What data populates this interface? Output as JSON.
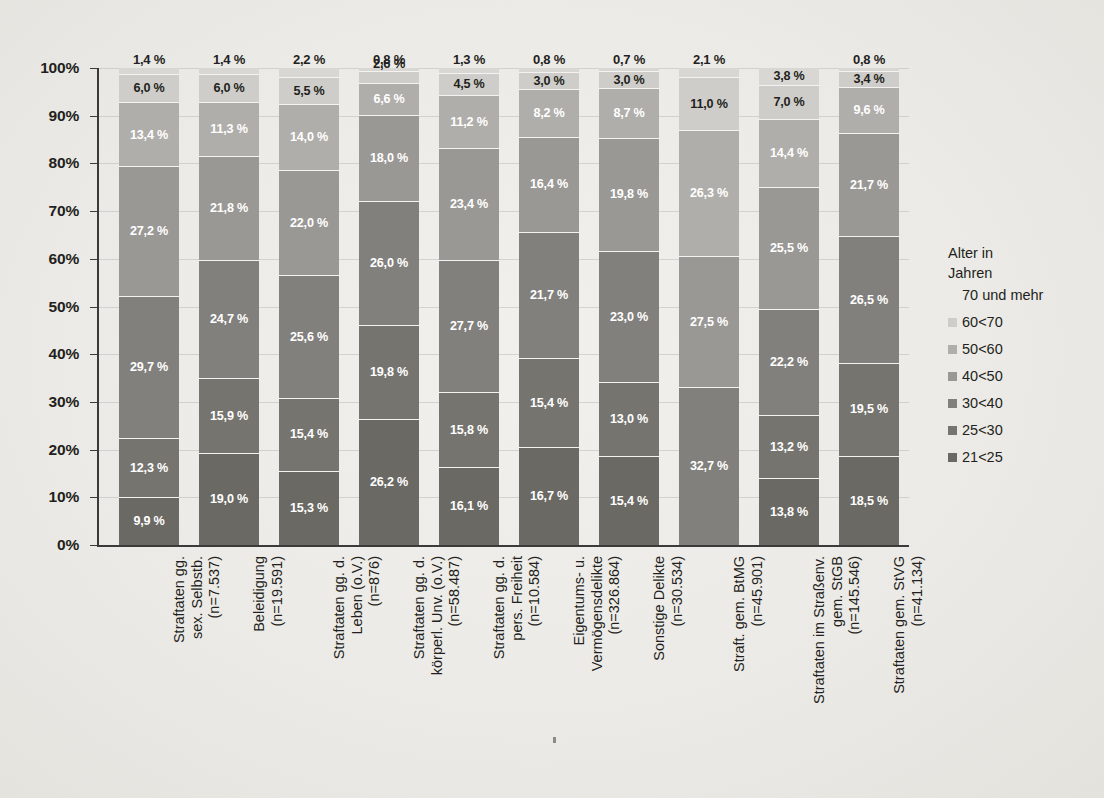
{
  "chart_data": {
    "type": "bar",
    "subtype": "stacked-percentage",
    "title": "",
    "xlabel": "",
    "ylabel": "",
    "ylim": [
      0,
      100
    ],
    "grid": true,
    "legend_position": "right",
    "ytick_labels": [
      "100%",
      "90%",
      "80%",
      "70%",
      "60%",
      "50%",
      "40%",
      "30%",
      "20%",
      "10%",
      "0%"
    ],
    "ytick_values": [
      100,
      90,
      80,
      70,
      60,
      50,
      40,
      30,
      20,
      10,
      0
    ],
    "categories": [
      "Straftaten gg.\nsex. Selbstb.\n(n=7.537)",
      "Beleidigung\n(n=19.591)",
      "Straftaten gg. d.\nLeben (o.V.)\n(n=876)",
      "Straftaten gg. d.\nkörperl. Unv. (o.V.)\n(n=58.487)",
      "Straftaten gg. d.\npers. Freiheit\n(n=10.584)",
      "Eigentums- u.\nVermögensdelikte\n(n=326.864)",
      "Sonstige Delikte\n(n=30.534)",
      "Straft. gem. BtMG\n(n=45.901)",
      "Straftaten im Straßenv.\ngem. StGB\n(n=145.546)",
      "Straftaten gem. StVG\n(n=41.134)"
    ],
    "series": [
      {
        "name": "70 und mehr",
        "color": "#d9d7d4",
        "values": [
          1.4,
          1.4,
          2.2,
          0.8,
          1.3,
          0.8,
          0.7,
          2.1,
          3.8,
          0.8
        ],
        "label_text": [
          "1,4 %",
          "1,4 %",
          "2,2 %",
          "0,8 %",
          "1,3 %",
          "0,8 %",
          "0,7 %",
          "2,1 %",
          "3,8 %",
          "0,8 %"
        ]
      },
      {
        "name": "60<70",
        "color": "#cfcdc9",
        "values": [
          6.0,
          6.0,
          5.5,
          2.6,
          4.5,
          3.0,
          3.0,
          11.0,
          7.0,
          3.4
        ],
        "label_text": [
          "6,0 %",
          "6,0 %",
          "5,5 %",
          "2,6 %",
          "4,5 %",
          "3,0 %",
          "3,0 %",
          "11,0 %",
          "7,0 %",
          "3,4 %"
        ]
      },
      {
        "name": "50<60",
        "color": "#b0aeaa",
        "values": [
          13.4,
          11.3,
          14.0,
          6.6,
          11.2,
          8.2,
          8.7,
          26.3,
          14.4,
          9.6
        ],
        "label_text": [
          "13,4 %",
          "11,3 %",
          "14,0 %",
          "6,6 %",
          "11,2 %",
          "8,2 %",
          "8,7 %",
          "26,3 %",
          "14,4 %",
          "9,6 %"
        ]
      },
      {
        "name": "40<50",
        "color": "#9a9894",
        "values": [
          27.2,
          21.8,
          22.0,
          18.0,
          23.4,
          16.4,
          19.8,
          27.5,
          25.5,
          21.7
        ],
        "label_text": [
          "27,2 %",
          "21,8 %",
          "22,0 %",
          "18,0 %",
          "23,4 %",
          "16,4 %",
          "19,8 %",
          "27,5 %",
          "25,5 %",
          "21,7 %"
        ]
      },
      {
        "name": "30<40",
        "color": "#82807c",
        "values": [
          29.7,
          24.7,
          25.6,
          26.0,
          27.7,
          21.7,
          23.0,
          32.7,
          22.2,
          26.5
        ],
        "label_text": [
          "29,7 %",
          "24,7 %",
          "25,6 %",
          "26,0 %",
          "27,7 %",
          "21,7 %",
          "23,0 %",
          "32,7 %",
          "22,2 %",
          "26,5 %"
        ]
      },
      {
        "name": "25<30",
        "color": "#76746f",
        "values": [
          12.3,
          15.9,
          15.4,
          19.8,
          15.8,
          15.4,
          13.0,
          0.0,
          13.2,
          19.5
        ],
        "label_text": [
          "12,3 %",
          "15,9 %",
          "15,4 %",
          "19,8 %",
          "15,8 %",
          "15,4 %",
          "13,0 %",
          "",
          "13,2 %",
          "19,5 %"
        ]
      },
      {
        "name": "21<25",
        "color": "#6b6964",
        "values": [
          9.9,
          19.0,
          15.3,
          26.2,
          16.1,
          16.7,
          15.4,
          0.0,
          13.8,
          18.5
        ],
        "label_text": [
          "9,9 %",
          "19,0 %",
          "15,3 %",
          "26,2 %",
          "16,1 %",
          "16,7 %",
          "15,4 %",
          "",
          "13,8 %",
          "18,5 %"
        ]
      }
    ]
  },
  "legend": {
    "title": "Alter in\nJahren",
    "items": [
      {
        "label": "70 und mehr",
        "color": "#d9d7d4",
        "swatch_visible": false
      },
      {
        "label": "60<70",
        "color": "#cfcdc9",
        "swatch_visible": true
      },
      {
        "label": "50<60",
        "color": "#b0aeaa",
        "swatch_visible": true
      },
      {
        "label": "40<50",
        "color": "#9a9894",
        "swatch_visible": true
      },
      {
        "label": "30<40",
        "color": "#82807c",
        "swatch_visible": true
      },
      {
        "label": "25<30",
        "color": "#76746f",
        "swatch_visible": true
      },
      {
        "label": "21<25",
        "color": "#6b6964",
        "swatch_visible": true
      }
    ]
  }
}
